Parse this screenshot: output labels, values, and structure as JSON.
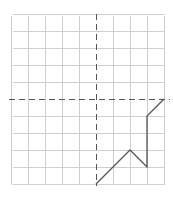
{
  "figure": {
    "title": "",
    "background_color": "#ffffff"
  },
  "chart_data": {
    "type": "line",
    "title": "",
    "xlabel": "",
    "ylabel": "",
    "grid": true,
    "legend": false,
    "axis_style": "dashed",
    "axis_color": "#555555",
    "grid_color": "#cfcfcf",
    "line_color": "#555555",
    "line_width": 1.2,
    "xlim": [
      -5,
      4
    ],
    "ylim": [
      -5,
      5
    ],
    "xticks": [
      -5,
      -4,
      -3,
      -2,
      -1,
      0,
      1,
      2,
      3,
      4
    ],
    "yticks": [
      -5,
      -4,
      -3,
      -2,
      -1,
      0,
      1,
      2,
      3,
      4,
      5
    ],
    "origin_px": [
      96,
      99
    ],
    "cell_px": 17,
    "plot_box_px": {
      "left": 12,
      "top": 15,
      "right": 164,
      "bottom": 184
    },
    "series": [
      {
        "name": "piecewise-path",
        "x": [
          0,
          2,
          3,
          3,
          4
        ],
        "y": [
          -5,
          -3,
          -4,
          -1,
          0
        ],
        "points_px": [
          [
            96,
            183
          ],
          [
            130,
            148
          ],
          [
            147,
            165
          ],
          [
            147,
            116
          ],
          [
            164,
            99
          ]
        ]
      }
    ],
    "annotations": []
  }
}
